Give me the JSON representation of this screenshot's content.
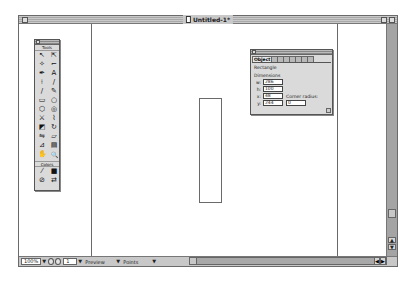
{
  "window": {
    "title": "Untitled-1*"
  },
  "tools_palette": {
    "title": "Tools",
    "tools": [
      {
        "name": "pointer",
        "glyph": "↖"
      },
      {
        "name": "subselect",
        "glyph": "⇱"
      },
      {
        "name": "lasso",
        "glyph": "✧"
      },
      {
        "name": "crop",
        "glyph": "⌐"
      },
      {
        "name": "pen",
        "glyph": "✒"
      },
      {
        "name": "text",
        "glyph": "A"
      },
      {
        "name": "bezigon",
        "glyph": "⟊"
      },
      {
        "name": "line",
        "glyph": "/"
      },
      {
        "name": "freeform",
        "glyph": "∕"
      },
      {
        "name": "pencil",
        "glyph": "✎"
      },
      {
        "name": "rectangle",
        "glyph": "▭"
      },
      {
        "name": "ellipse",
        "glyph": "○"
      },
      {
        "name": "polygon",
        "glyph": "⬡"
      },
      {
        "name": "spiral",
        "glyph": "◎"
      },
      {
        "name": "knife",
        "glyph": "⚔"
      },
      {
        "name": "trace",
        "glyph": "⌇"
      },
      {
        "name": "scale",
        "glyph": "◩"
      },
      {
        "name": "rotate",
        "glyph": "↻"
      },
      {
        "name": "reflect",
        "glyph": "⇋"
      },
      {
        "name": "skew",
        "glyph": "▱"
      },
      {
        "name": "eyedropper",
        "glyph": "⊿"
      },
      {
        "name": "chart",
        "glyph": "▤"
      },
      {
        "name": "hand",
        "glyph": "✋"
      },
      {
        "name": "zoom",
        "glyph": "🔍"
      }
    ],
    "colors_label": "Colors",
    "color_tools": [
      {
        "name": "stroke-color",
        "glyph": "⁄"
      },
      {
        "name": "fill-color",
        "glyph": "■"
      },
      {
        "name": "no-color",
        "glyph": "⊘"
      },
      {
        "name": "swap-colors",
        "glyph": "⇄"
      }
    ]
  },
  "object_panel": {
    "tabs": [
      {
        "label": "Object",
        "active": true
      },
      {
        "label": ""
      },
      {
        "label": ""
      },
      {
        "label": ""
      },
      {
        "label": ""
      },
      {
        "label": ""
      },
      {
        "label": ""
      },
      {
        "label": ""
      }
    ],
    "object_type": "Rectangle",
    "section_label": "Dimensions",
    "fields": [
      {
        "label": "w:",
        "value": "286"
      },
      {
        "label": "h:",
        "value": "100"
      },
      {
        "label": "x:",
        "value": "48"
      },
      {
        "label": "y:",
        "value": "244"
      }
    ],
    "corner_radius_label": "Corner radius:",
    "corner_radius_value": "0"
  },
  "status_bar": {
    "zoom_value": "100%",
    "page_value": "1",
    "view_mode": "Preview",
    "units": "Points"
  },
  "colors": {
    "chrome": "#c8c8c8",
    "border": "#6a6a6a",
    "canvas": "#ffffff"
  }
}
